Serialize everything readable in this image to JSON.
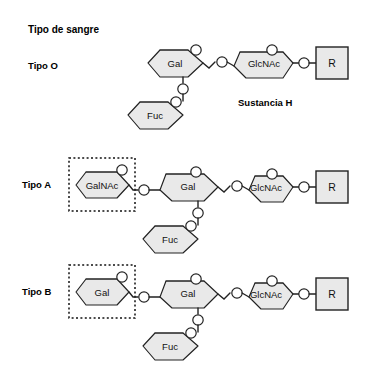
{
  "figure": {
    "title": "Tipo de sangre",
    "background_color": "#ffffff",
    "sugar_fill_color": "#e9e9e9",
    "line_color": "#222222",
    "text_color": "#000000"
  },
  "rows": [
    {
      "id": "tipo-o",
      "label": "Tipo O",
      "annotation": "Sustancia H",
      "has_dashed_box": false,
      "terminal_sugar": null,
      "sugars": [
        "Gal",
        "GlcNAc",
        "Fuc"
      ],
      "terminal_group": "R"
    },
    {
      "id": "tipo-a",
      "label": "Tipo A",
      "annotation": null,
      "has_dashed_box": true,
      "terminal_sugar": "GalNAc",
      "sugars": [
        "GalNAc",
        "Gal",
        "GlcNAc",
        "Fuc"
      ],
      "terminal_group": "R"
    },
    {
      "id": "tipo-b",
      "label": "Tipo B",
      "annotation": null,
      "has_dashed_box": true,
      "terminal_sugar": "Gal",
      "sugars": [
        "Gal",
        "Gal",
        "GlcNAc",
        "Fuc"
      ],
      "terminal_group": "R"
    }
  ],
  "labels": {
    "gal": "Gal",
    "galnac": "GalNAc",
    "glcnac": "GlcNAc",
    "fuc": "Fuc",
    "r": "R",
    "oxygen": "O"
  }
}
